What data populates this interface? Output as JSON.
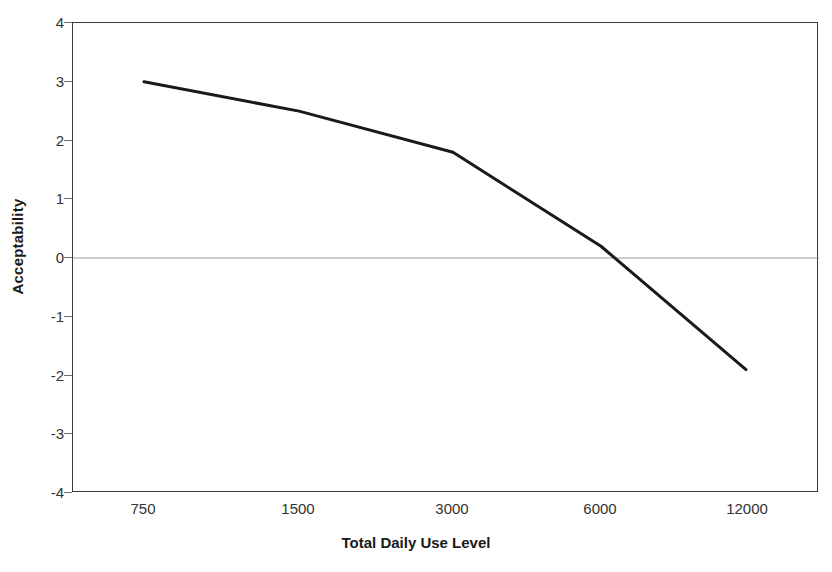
{
  "chart_data": {
    "type": "line",
    "title": "",
    "subtitle": "",
    "xlabel": "Total Daily Use Level",
    "ylabel": "Acceptability",
    "categories": [
      "750",
      "1500",
      "3000",
      "6000",
      "12000"
    ],
    "x": [
      750,
      1500,
      3000,
      6000,
      12000
    ],
    "values": [
      3.0,
      2.5,
      1.8,
      0.2,
      -1.9
    ],
    "series": [
      {
        "name": "Acceptability",
        "values": [
          3.0,
          2.5,
          1.8,
          0.2,
          -1.9
        ],
        "color": "#1a1a1a"
      }
    ],
    "ylim": [
      -4,
      4
    ],
    "y_ticks": [
      4,
      3,
      2,
      1,
      0,
      -1,
      -2,
      -3,
      -4
    ],
    "y_tick_labels": [
      "4",
      "3",
      "2",
      "1",
      "0",
      "-1",
      "-2",
      "-3",
      "-4"
    ],
    "x_tick_labels": [
      "750",
      "1500",
      "3000",
      "6000",
      "12000"
    ],
    "x_axis_scale": "categorical",
    "grid": false,
    "zero_line": true,
    "zero_line_color": "#9a9a9a",
    "legend": "none",
    "legend_position": "none",
    "annotations": [],
    "plot_background": "#ffffff",
    "frame_color": "#3a3a3a",
    "line_color": "#1a1a1a",
    "line_width": 3
  }
}
